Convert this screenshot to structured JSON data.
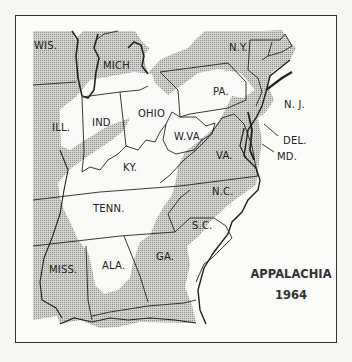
{
  "map": {
    "title": "APPALACHIA",
    "year": "1964",
    "colors": {
      "shade": "#b9b9b6",
      "appalachia": "#f7f7f5",
      "border": "#222222",
      "frame": "#333333"
    },
    "states": [
      {
        "id": "wis",
        "label": "WIS.",
        "x": 34,
        "y": 42
      },
      {
        "id": "mich",
        "label": "MICH",
        "x": 102,
        "y": 62
      },
      {
        "id": "ny",
        "label": "N.Y.",
        "x": 229,
        "y": 44
      },
      {
        "id": "pa",
        "label": "PA.",
        "x": 213,
        "y": 88
      },
      {
        "id": "nj",
        "label": "N. J.",
        "x": 285,
        "y": 101
      },
      {
        "id": "ill",
        "label": "ILL.",
        "x": 52,
        "y": 124
      },
      {
        "id": "ind",
        "label": "IND",
        "x": 92,
        "y": 119
      },
      {
        "id": "ohio",
        "label": "OHIO",
        "x": 138,
        "y": 110
      },
      {
        "id": "wva",
        "label": "W.VA.",
        "x": 174,
        "y": 133
      },
      {
        "id": "del",
        "label": "DEL.",
        "x": 283,
        "y": 137
      },
      {
        "id": "md",
        "label": "MD.",
        "x": 277,
        "y": 153
      },
      {
        "id": "va",
        "label": "VA.",
        "x": 216,
        "y": 152
      },
      {
        "id": "ky",
        "label": "KY.",
        "x": 123,
        "y": 164
      },
      {
        "id": "nc",
        "label": "N.C.",
        "x": 212,
        "y": 188
      },
      {
        "id": "tenn",
        "label": "TENN.",
        "x": 93,
        "y": 205
      },
      {
        "id": "sc",
        "label": "S.C.",
        "x": 192,
        "y": 222
      },
      {
        "id": "ga",
        "label": "GA.",
        "x": 156,
        "y": 253
      },
      {
        "id": "ala",
        "label": "ALA.",
        "x": 102,
        "y": 262
      },
      {
        "id": "miss",
        "label": "MISS.",
        "x": 49,
        "y": 266
      }
    ]
  }
}
